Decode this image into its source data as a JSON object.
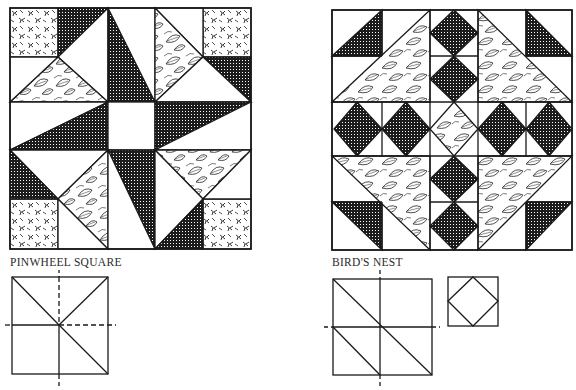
{
  "page": {
    "colors": {
      "ink": "#1a1a1a",
      "paper": "#ffffff",
      "check": "#222222"
    },
    "fabrics": [
      "checked-dark",
      "leaf-print",
      "twig-print",
      "plain-white"
    ]
  },
  "blocks": [
    {
      "name": "Pinwheel Square",
      "label": "PINWHEEL SQUARE",
      "grid": "5x5",
      "diagram": {
        "description": "square divided in quadrants with diagonals; dashed center axes"
      }
    },
    {
      "name": "Bird's Nest",
      "label": "BIRD'S NEST",
      "grid": "5x5",
      "diagram": {
        "description": "2x2 grid with diagonal halves; separate square-in-square unit"
      }
    }
  ]
}
